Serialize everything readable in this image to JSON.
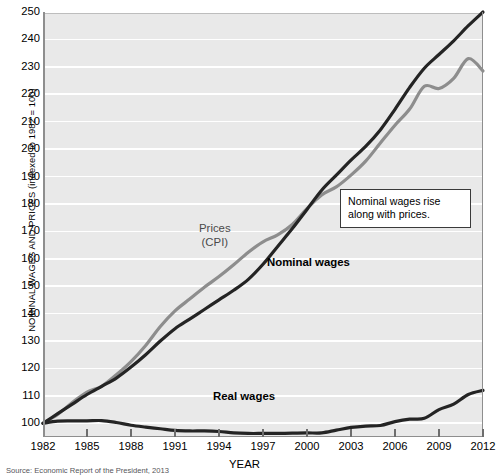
{
  "figure": {
    "source_note": "Source: Economic Report of the President, 2013"
  },
  "annotation": {
    "text": "Nominal wages rise along with prices."
  },
  "labels": {
    "prices": "Prices\n(CPI)",
    "nominal": "Nominal wages",
    "real": "Real wages"
  },
  "colors": {
    "plot_background": "#e9e9e9",
    "gridline": "#ffffff",
    "nominal_wages": "#242424",
    "prices_cpi": "#8d8d8d",
    "real_wages": "#242424",
    "axis": "#8e8e8e"
  },
  "chart_data": {
    "type": "line",
    "title": "",
    "xlabel": "YEAR",
    "ylabel": "NOMINAL WAGES AND PRICES (indexed to 1982 = 100)",
    "xlim": [
      1982,
      2012
    ],
    "ylim": [
      95,
      250
    ],
    "ytick_values": [
      100,
      110,
      120,
      130,
      140,
      150,
      160,
      170,
      180,
      190,
      200,
      210,
      220,
      230,
      240,
      250
    ],
    "ytick_labels": [
      "100",
      "110",
      "120",
      "130",
      "140",
      "150",
      "160",
      "170",
      "180",
      "190",
      "200",
      "210",
      "220",
      "230",
      "240",
      "250"
    ],
    "xtick_values": [
      1982,
      1985,
      1988,
      1991,
      1994,
      1997,
      2000,
      2003,
      2006,
      2009,
      2012
    ],
    "xtick_labels": [
      "1982",
      "1985",
      "1988",
      "1991",
      "1994",
      "1997",
      "2000",
      "2003",
      "2006",
      "2009",
      "2012"
    ],
    "grid": "horizontal",
    "legend": "inline-series-labels",
    "x": [
      1982,
      1983,
      1984,
      1985,
      1986,
      1987,
      1988,
      1989,
      1990,
      1991,
      1992,
      1993,
      1994,
      1995,
      1996,
      1997,
      1998,
      1999,
      2000,
      2001,
      2002,
      2003,
      2004,
      2005,
      2006,
      2007,
      2008,
      2009,
      2010,
      2011,
      2012
    ],
    "series": [
      {
        "name": "Nominal wages",
        "color": "#242424",
        "style": "solid-bold",
        "values": [
          100.0,
          103.5,
          107.0,
          110.5,
          113.5,
          116.5,
          120.5,
          125.0,
          130.0,
          134.5,
          138.0,
          141.5,
          145.0,
          148.5,
          152.5,
          158.0,
          164.5,
          171.0,
          178.0,
          185.0,
          190.5,
          196.0,
          201.0,
          207.0,
          214.5,
          222.5,
          229.5,
          234.5,
          239.5,
          245.0,
          250.0
        ]
      },
      {
        "name": "Prices (CPI)",
        "color": "#8d8d8d",
        "style": "solid-bold",
        "values": [
          100.0,
          103.2,
          107.6,
          111.4,
          113.5,
          117.7,
          122.5,
          128.4,
          135.3,
          141.0,
          145.3,
          149.6,
          153.5,
          157.8,
          162.4,
          166.2,
          168.7,
          172.5,
          178.3,
          183.3,
          186.2,
          190.5,
          195.6,
          202.2,
          208.7,
          214.6,
          222.9,
          222.1,
          225.8,
          233.0,
          228.5
        ]
      },
      {
        "name": "Real wages",
        "color": "#242424",
        "style": "solid-bold",
        "values": [
          100.0,
          100.8,
          100.9,
          100.9,
          101.0,
          100.3,
          99.3,
          98.6,
          98.0,
          97.4,
          97.2,
          97.2,
          97.0,
          96.5,
          96.3,
          96.3,
          96.3,
          96.4,
          96.5,
          96.5,
          97.5,
          98.5,
          99.0,
          99.2,
          100.6,
          101.5,
          101.8,
          105.0,
          107.0,
          110.5,
          112.0
        ]
      }
    ]
  }
}
